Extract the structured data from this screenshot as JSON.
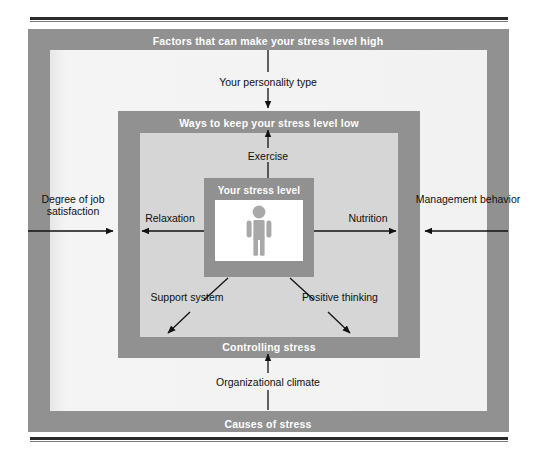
{
  "diagram": {
    "colors": {
      "band_gray": "#919191",
      "outer_inner": "#f2f2f2",
      "middle_inner": "#d6d6d6",
      "center_white": "#ffffff",
      "figure_gray": "#a8a8a8",
      "text_dark": "#0f0f0f",
      "text_light": "#ffffff",
      "rule": "#2b2b2b"
    },
    "bands": {
      "outer_top_label": "Factors that can make your stress level high",
      "outer_bottom_label": "Causes of stress",
      "middle_top_label": "Ways to keep your stress level low",
      "middle_bottom_label": "Controlling stress",
      "center_label": "Your stress level"
    },
    "icon": {
      "name": "person-pictogram",
      "description": "Gray human figure pictogram representing the person"
    },
    "labels": {
      "personality": "Your personality type",
      "exercise": "Exercise",
      "organizational_climate": "Organizational climate",
      "job_satisfaction": "Degree of job satisfaction",
      "management_behavior": "Management behavior",
      "relaxation": "Relaxation",
      "nutrition": "Nutrition",
      "support_system": "Support system",
      "positive_thinking": "Positive thinking"
    },
    "arrows": [
      {
        "name": "arrow-personality-inward",
        "label": "Your personality type",
        "direction": "down",
        "meaning": "stressor entering from outer band"
      },
      {
        "name": "arrow-exercise-outward",
        "label": "Exercise",
        "direction": "up",
        "meaning": "coping strategy leaving the center"
      },
      {
        "name": "arrow-org-climate-inward",
        "label": "Organizational climate",
        "direction": "up",
        "meaning": "stressor entering from outer band"
      },
      {
        "name": "arrow-job-satisfaction-inward",
        "label": "Degree of job satisfaction",
        "direction": "right",
        "meaning": "stressor entering from outer band"
      },
      {
        "name": "arrow-management-inward",
        "label": "Management behavior",
        "direction": "left",
        "meaning": "stressor entering from outer band"
      },
      {
        "name": "arrow-relaxation-outward",
        "label": "Relaxation",
        "direction": "left",
        "meaning": "coping strategy leaving the center"
      },
      {
        "name": "arrow-nutrition-outward",
        "label": "Nutrition",
        "direction": "right",
        "meaning": "coping strategy leaving the center"
      },
      {
        "name": "arrow-support-outward",
        "label": "Support system",
        "direction": "down-left",
        "meaning": "coping strategy leaving the center"
      },
      {
        "name": "arrow-positive-outward",
        "label": "Positive thinking",
        "direction": "down-right",
        "meaning": "coping strategy leaving the center"
      }
    ]
  }
}
